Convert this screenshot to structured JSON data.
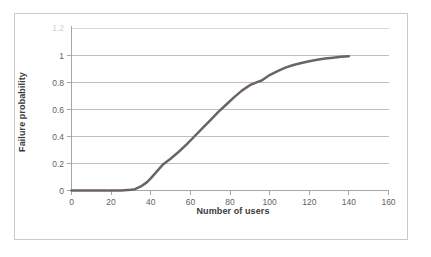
{
  "figure": {
    "frame_border_color": "#c9c9c9",
    "background_color": "#ffffff"
  },
  "chart_data": {
    "type": "line",
    "title": "",
    "subtitle": "",
    "xlabel": "Number of users",
    "ylabel": "Failure probability",
    "xlim": [
      0,
      160
    ],
    "ylim": [
      0,
      1.2
    ],
    "xticks": [
      0,
      20,
      40,
      60,
      80,
      100,
      120,
      140,
      160
    ],
    "xtick_labels": [
      "0",
      "20",
      "40",
      "60",
      "80",
      "100",
      "120",
      "140",
      "160"
    ],
    "yticks": [
      0,
      0.2,
      0.4,
      0.6,
      0.8,
      1,
      1.2
    ],
    "ytick_labels": [
      "0",
      "0.2",
      "0.4",
      "0.6",
      "0.8",
      "1",
      "1.2"
    ],
    "ytick_top_clipped": true,
    "grid": {
      "horizontal": true,
      "vertical": false,
      "color": "#bfbfbf"
    },
    "legend": {
      "visible": false,
      "position": "none",
      "entries": []
    },
    "annotations": [],
    "series": [
      {
        "name": "Failure probability",
        "color": "#6b6460",
        "line_width": 2.5,
        "marker": "none",
        "x": [
          0,
          5,
          10,
          15,
          20,
          25,
          30,
          32,
          35,
          38,
          40,
          43,
          46,
          50,
          54,
          58,
          62,
          66,
          70,
          74,
          78,
          82,
          86,
          90,
          94,
          96,
          100,
          104,
          108,
          112,
          116,
          120,
          124,
          128,
          132,
          136,
          140
        ],
        "values": [
          0,
          0,
          0,
          0,
          0,
          0,
          0.005,
          0.01,
          0.03,
          0.06,
          0.09,
          0.14,
          0.19,
          0.235,
          0.285,
          0.34,
          0.4,
          0.46,
          0.52,
          0.58,
          0.635,
          0.69,
          0.74,
          0.78,
          0.805,
          0.815,
          0.855,
          0.885,
          0.91,
          0.93,
          0.945,
          0.958,
          0.968,
          0.977,
          0.984,
          0.99,
          0.995
        ]
      }
    ]
  }
}
